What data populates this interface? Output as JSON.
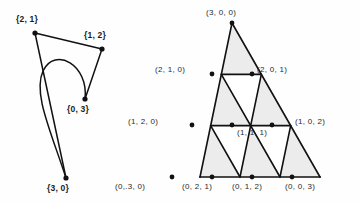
{
  "figure": {
    "background_color": "#fefefe",
    "stroke_color": "#111111",
    "shaded_triangle_color": "#ececec",
    "unshaded_triangle_color": "#ffffff"
  },
  "left_diagram": {
    "name": "curved-loop-diagram",
    "vertices": [
      {
        "label": "{2, 1}",
        "x": 35,
        "y": 33,
        "label_x": 16,
        "label_y": 14
      },
      {
        "label": "{1, 2}",
        "x": 102,
        "y": 49,
        "label_x": 84,
        "label_y": 30
      },
      {
        "label": "{0, 3}",
        "x": 85,
        "y": 99,
        "label_x": 67,
        "label_y": 104
      },
      {
        "label": "{3, 0}",
        "x": 66,
        "y": 178,
        "label_x": 47,
        "label_y": 183
      }
    ],
    "edges": [
      {
        "from": "{2, 1}",
        "to": "{1, 2}",
        "type": "straight"
      },
      {
        "from": "{2, 1}",
        "to": "{3, 0}",
        "type": "straight"
      },
      {
        "from": "{1, 2}",
        "to": "{0, 3}",
        "type": "straight"
      },
      {
        "from": "{0, 3}",
        "to": "{3, 0}",
        "type": "curved-loop"
      }
    ]
  },
  "right_diagram": {
    "name": "subdivided-simplex-lattice",
    "subdivision_level": 3,
    "apex": {
      "x": 232,
      "y": 23
    },
    "bottom_left": {
      "x": 200,
      "y": 177
    },
    "bottom_right": {
      "x": 320,
      "y": 177
    },
    "lattice_points": [
      {
        "label": "(3, 0, 0)",
        "row": 0,
        "col": 0,
        "x": 232,
        "y": 23,
        "label_x": 206,
        "label_y": 8,
        "anchor": "center"
      },
      {
        "label": "(2, 1, 0)",
        "row": 1,
        "col": 0,
        "x": 212,
        "y": 74,
        "label_x": 155,
        "label_y": 65,
        "anchor": "left"
      },
      {
        "label": "(2, 0, 1)",
        "row": 1,
        "col": 1,
        "x": 252,
        "y": 74,
        "label_x": 257,
        "label_y": 65,
        "anchor": "right"
      },
      {
        "label": "(1, 2, 0)",
        "row": 2,
        "col": 0,
        "x": 192,
        "y": 125,
        "label_x": 128,
        "label_y": 117,
        "anchor": "left"
      },
      {
        "label": "(1, 1, 1)",
        "row": 2,
        "col": 1,
        "x": 232,
        "y": 125,
        "label_x": 237,
        "label_y": 128,
        "anchor": "right"
      },
      {
        "label": "(1, 0, 2)",
        "row": 2,
        "col": 2,
        "x": 272,
        "y": 125,
        "label_x": 295,
        "label_y": 117,
        "anchor": "right"
      },
      {
        "label": "(0,.3, 0)",
        "row": 3,
        "col": 0,
        "x": 172,
        "y": 177,
        "label_x": 115,
        "label_y": 182,
        "anchor": "center"
      },
      {
        "label": "(0, 2, 1)",
        "row": 3,
        "col": 1,
        "x": 212,
        "y": 177,
        "label_x": 182,
        "label_y": 182,
        "anchor": "center"
      },
      {
        "label": "(0, 1, 2)",
        "row": 3,
        "col": 2,
        "x": 252,
        "y": 177,
        "label_x": 232,
        "label_y": 182,
        "anchor": "center"
      },
      {
        "label": "(0, 0, 3)",
        "row": 3,
        "col": 3,
        "x": 292,
        "y": 177,
        "label_x": 285,
        "label_y": 182,
        "anchor": "center"
      }
    ],
    "shaded_cells": [
      "up-0-0",
      "up-1-0",
      "up-1-1",
      "up-2-0",
      "up-2-1",
      "up-2-2"
    ],
    "unshaded_cells": [
      "down-1-0",
      "down-2-0",
      "down-2-1"
    ]
  }
}
